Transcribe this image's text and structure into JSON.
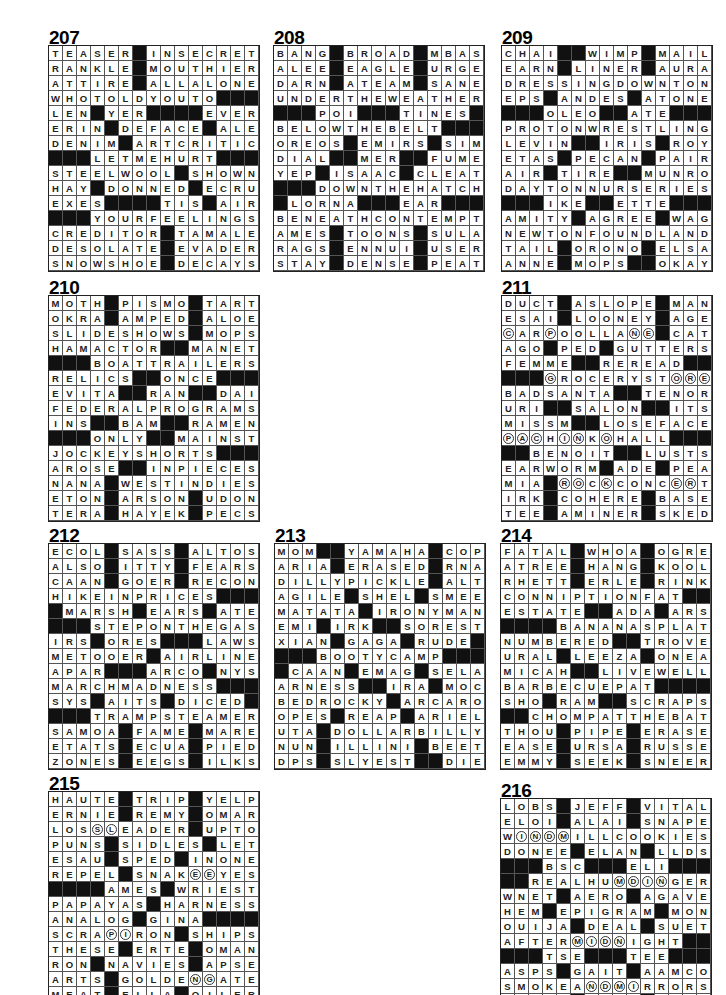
{
  "page": {
    "background": "#ffffff",
    "puzzles": [
      {
        "number": "207",
        "x": 48,
        "y": 30,
        "rows": [
          "TEASER#INSECRET",
          "RANKLE#MOUTHIER",
          "ATTIRE#ALLALONE",
          "WHOTOLDYOUTO###",
          "LEN#YER####EVER",
          "ERIN#DEFACE#ALE",
          "DENIM#ARTCRITIC",
          "###LETMEHURT###",
          "STEELWOOL#SHOWN",
          "HAY#DONNED#ECRU",
          "EXES####TIS#AIR",
          "###YOURFEELINGS",
          "CREDITOR#TAMALE",
          "DESOLATE#EVADER",
          "SNOWSHOE#DECAYS"
        ]
      },
      {
        "number": "208",
        "x": 273,
        "y": 30,
        "rows": [
          "BANG#BROAD#MBAS",
          "ALEE#EAGLE#URGE",
          "DARN#ATEAM#SANE",
          "UNDERTHEWEATHER",
          "###POI###TINES#",
          "BELOWTHEBELT###",
          "OREOS#EMIRS#SIM",
          "DIAL##MER##FUME",
          "YEP#ISAAC#CLEAT",
          "###DOWNTHEHATCH",
          "#LORNA###EAR###",
          "BENEATHCONTEMPT",
          "AMES#TOONS#SULA",
          "RAGS#ENNUI#USER",
          "STAY#DENSE#PEAT"
        ]
      },
      {
        "number": "209",
        "x": 501,
        "y": 30,
        "rows": [
          "CHAI##WIMP#MAIL",
          "EARN#LINER#AURA",
          "DRESSINGDOWNTON",
          "EPS#ANDES#ATONE",
          "###OLEO##ATE###",
          "PROTONWRESTLING",
          "LEVIN##IRIS#ROY",
          "ETAS#PECAN#PAIR",
          "AIR#TIRE##MUNRO",
          "DAYTONNURSERIES",
          "###IKE##ETTE###",
          "AMITY#AGREE#WAG",
          "NEWTONFOUNDLAND",
          "TAIL#ORONO#ELSA",
          "ANNE#MOPS##OKAY"
        ]
      },
      {
        "number": "210",
        "x": 48,
        "y": 280,
        "rows": [
          "MOTH#PISMO#TART",
          "OKRA#AMPED#ALOE",
          "SLIDESHOWS#MOPS",
          "HAMACTOR##MANET",
          "###BOATTRAILERS",
          "RELICS##ONCE###",
          "EVITA##RAN##DAI",
          "FEDERALPROGRAMS",
          "INS##BAM##RAMEN",
          "###ONLY##MAINST",
          "JOCKEYSHORTS###",
          "AROSE##INPIECES",
          "NANA#WESTINDIES",
          "ETON#ARSON#UDON",
          "TERA#HAYEK#PECS"
        ]
      },
      {
        "number": "211",
        "x": 501,
        "y": 280,
        "rows": [
          "DUCT#ASLOPE#MAN",
          "ESAI#LOONEY#AGE",
          "cARpOOLLAne#CAT",
          "AGO#PED#GUTTERS",
          "FEMME##REREAD##",
          "###gROCERYSTore",
          "BADSANTA##TENOR",
          "URI##SALON##ITS",
          "MISSM##LOSEFACE",
          "pacHinKoHALL###",
          "##BENOIT##LUSTS",
          "EARWORM#ADE#PEA",
          "MIA#roCkCONCerT",
          "IRK#COHERE#BASE",
          "TEE#AMINER#SKED"
        ]
      },
      {
        "number": "212",
        "x": 48,
        "y": 528,
        "rows": [
          "ECOL#SASS#ALTOS",
          "ALSO#ITTY#FEARS",
          "CAAN#GOER#RECON",
          "HIKEINPRICES###",
          "#MARSH#EARS#ATE",
          "###STEPONTHEGAS",
          "IRS#ORES###LAWS",
          "METOOER#AIRLINE",
          "APAR###ARCO#NYS",
          "MARCHMADNESS###",
          "SYS#AITS#DICED#",
          "###TRAMPSTEAMER",
          "SAMOA#FAME#MARE",
          "ETATS#ECUA#PIED",
          "ZONES#EEGS#ILKS"
        ]
      },
      {
        "number": "213",
        "x": 274,
        "y": 528,
        "rows": [
          "MOM##YAMAHA#COP",
          "ARIA#ERASED#RNA",
          "DILLYPICKLE#ALT",
          "AGILE#SHEL#SMEE",
          "MATATA#IRONYMAN",
          "EMI#IRK##SOREST",
          "XIAN#GAGA#RUDE#",
          "###BOOTYCAMP###",
          "#CAAN#EMAG#SELA",
          "ARNESS##IRA#MOC",
          "BEDROCKY#ARCARO",
          "OPES#REAP#ARIEL",
          "UTA#DOLLARBILLY",
          "NUN#ILLINI#BEET",
          "DPS#SLYEST##DIE"
        ]
      },
      {
        "number": "214",
        "x": 500,
        "y": 528,
        "rows": [
          "FATAL#WHOA#OGRE",
          "ATREE#HANG#KOOL",
          "RHETT#ERLE#RINK",
          "CONNIPTIONFAT##",
          "ESTATE##ADA#ARS",
          "####BANANASPLAT",
          "NUMBERED##TROVE",
          "URAL#LEEZA#ONEA",
          "MICAH##LIVEWELL",
          "BARBECUEPAT####",
          "SHO#RAM##SCRAPS",
          "##CHOMPATTHEBAT",
          "THOU#PIPE#ERASE",
          "EASE#URSA#RUSSE",
          "EMMY#SEEK#SNEER"
        ]
      },
      {
        "number": "215",
        "x": 48,
        "y": 776,
        "rows": [
          "HAUTE#TRIP#YELP",
          "ERNIE#REMY#OMAR",
          "LOSslEADER#UPTO",
          "PUNS#SIDLES#LET",
          "ESAU#SPED#INONE",
          "REPEL#SNAKeeYES",
          "####AMES#WRIEST",
          "PAPAYAS#HARNESS",
          "ANALOG#GINA####",
          "SCRApiRON#SHIPS",
          "THESE#ERTE#OMAN",
          "RON#NAVIES#APSE",
          "ARTS#GOLDEngATE",
          "MEAT#ELLA#OILER"
        ]
      },
      {
        "number": "216",
        "x": 500,
        "y": 783,
        "rows": [
          "LOBS#JEFF#VITAL",
          "ELOI#ALAI#SNAPE",
          "WindmILLCOOKIES",
          "DONEE#ELAN#LLDS",
          "###BSC###ELI###",
          "##REALHUmdinGER",
          "WNET#AERO#AGAVE",
          "HEM#EPIGRAM#MON",
          "OUIJA#DEAL#SUET",
          "AFTERmidnIGHT##",
          "###TSE###TEE###",
          "ASPS#GAIT#AAMCO",
          "SMOKEAndmiRRORS",
          "TUMID#TEAR#ELAI"
        ]
      }
    ]
  }
}
